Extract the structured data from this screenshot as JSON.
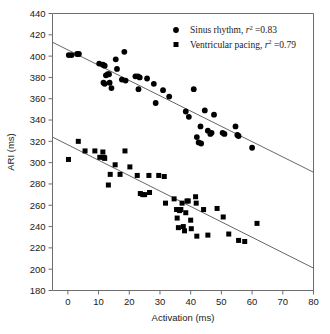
{
  "figure": {
    "background_color": "#ffffff",
    "marker_color": "#000000",
    "axis_color": "#6e6e6e",
    "fit_line_color": "#555555"
  },
  "axes": {
    "x": {
      "label": "Activation (ms)",
      "ticks": [
        0,
        10,
        20,
        30,
        40,
        50,
        60,
        70,
        80
      ],
      "min": -5,
      "max": 80
    },
    "y": {
      "label": "ARI (ms)",
      "ticks": [
        180,
        200,
        220,
        240,
        260,
        280,
        300,
        320,
        340,
        360,
        380,
        400,
        420,
        440
      ],
      "min": 180,
      "max": 440
    }
  },
  "legend": {
    "position": "top-right",
    "entries": [
      {
        "marker": "circle",
        "name": "Sinus rhythm",
        "prefix": "Sinus rhythm, ",
        "stat_symbol": "r",
        "stat_exponent": "2",
        "stat_value": " =0.83",
        "full_label": "Sinus rhythm, r2 =0.83"
      },
      {
        "marker": "square",
        "name": "Ventricular pacing",
        "prefix": "Ventricular pacing, ",
        "stat_symbol": "r",
        "stat_exponent": "2",
        "stat_value": " =0.79",
        "full_label": "Ventricular pacing, r2 =0.79"
      }
    ]
  },
  "chart_data": {
    "type": "scatter",
    "title": "",
    "xlabel": "Activation (ms)",
    "ylabel": "ARI (ms)",
    "xlim": [
      -5,
      80
    ],
    "ylim": [
      180,
      440
    ],
    "grid": false,
    "legend_position": "top-right",
    "series": [
      {
        "name": "Sinus rhythm",
        "marker": "circle",
        "r_squared": 0.83,
        "color": "#000000",
        "points": [
          [
            0.3,
            401
          ],
          [
            1.2,
            401
          ],
          [
            3.0,
            402
          ],
          [
            3.6,
            402
          ],
          [
            10.2,
            393
          ],
          [
            11.4,
            392
          ],
          [
            12.0,
            391
          ],
          [
            11.6,
            375
          ],
          [
            12.0,
            374
          ],
          [
            12.4,
            382
          ],
          [
            13.0,
            383
          ],
          [
            13.4,
            383
          ],
          [
            13.6,
            375
          ],
          [
            14.2,
            370
          ],
          [
            15.6,
            397
          ],
          [
            16.0,
            388
          ],
          [
            17.6,
            378
          ],
          [
            18.4,
            404
          ],
          [
            18.8,
            377
          ],
          [
            22.0,
            381
          ],
          [
            22.8,
            381
          ],
          [
            23.4,
            380
          ],
          [
            23.0,
            369
          ],
          [
            25.8,
            379
          ],
          [
            28.6,
            356
          ],
          [
            28.0,
            374
          ],
          [
            31.0,
            368
          ],
          [
            33.0,
            362
          ],
          [
            38.4,
            348
          ],
          [
            39.4,
            343
          ],
          [
            41.0,
            369
          ],
          [
            43.2,
            334
          ],
          [
            42.0,
            324
          ],
          [
            42.6,
            319
          ],
          [
            43.4,
            318
          ],
          [
            44.6,
            349
          ],
          [
            45.6,
            330
          ],
          [
            46.4,
            327
          ],
          [
            46.8,
            328
          ],
          [
            47.6,
            345
          ],
          [
            50.4,
            328
          ],
          [
            51.0,
            327
          ],
          [
            54.6,
            334
          ],
          [
            55.2,
            326
          ],
          [
            55.6,
            325
          ],
          [
            60.0,
            314
          ]
        ]
      },
      {
        "name": "Ventricular pacing",
        "marker": "square",
        "r_squared": 0.79,
        "color": "#000000",
        "points": [
          [
            0.2,
            303
          ],
          [
            3.4,
            320
          ],
          [
            5.6,
            311
          ],
          [
            8.8,
            311
          ],
          [
            10.4,
            305
          ],
          [
            11.4,
            310
          ],
          [
            11.8,
            305
          ],
          [
            12.0,
            304
          ],
          [
            13.2,
            279
          ],
          [
            13.8,
            289
          ],
          [
            15.4,
            298
          ],
          [
            17.0,
            289
          ],
          [
            18.6,
            311
          ],
          [
            20.2,
            296
          ],
          [
            22.6,
            288
          ],
          [
            23.6,
            271
          ],
          [
            24.4,
            270
          ],
          [
            25.0,
            270
          ],
          [
            26.6,
            272
          ],
          [
            26.4,
            288
          ],
          [
            29.6,
            288
          ],
          [
            31.8,
            262
          ],
          [
            31.4,
            287
          ],
          [
            34.6,
            266
          ],
          [
            35.4,
            256
          ],
          [
            35.6,
            248
          ],
          [
            36.0,
            239
          ],
          [
            36.4,
            255
          ],
          [
            36.8,
            256
          ],
          [
            37.2,
            262
          ],
          [
            37.6,
            240
          ],
          [
            38.0,
            236
          ],
          [
            38.4,
            253
          ],
          [
            38.8,
            264
          ],
          [
            39.2,
            264
          ],
          [
            40.0,
            246
          ],
          [
            40.2,
            238
          ],
          [
            41.6,
            268
          ],
          [
            41.8,
            262
          ],
          [
            42.0,
            231
          ],
          [
            44.2,
            256
          ],
          [
            45.6,
            232
          ],
          [
            48.6,
            257
          ],
          [
            50.6,
            249
          ],
          [
            52.4,
            233
          ],
          [
            55.6,
            227
          ],
          [
            57.6,
            226
          ],
          [
            61.6,
            243
          ]
        ]
      }
    ],
    "fit_lines": [
      {
        "series": "Sinus rhythm",
        "x_start": -5,
        "y_start": 413,
        "x_end": 80,
        "y_end": 291
      },
      {
        "series": "Ventricular pacing",
        "x_start": -5,
        "y_start": 324,
        "x_end": 80,
        "y_end": 201
      }
    ]
  }
}
